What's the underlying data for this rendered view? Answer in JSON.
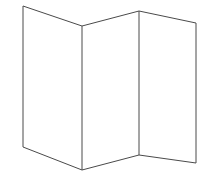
{
  "figure": {
    "kind": "line-drawing",
    "canvas": {
      "width": 212,
      "height": 184
    },
    "colors": {
      "background": "#ffffff",
      "stroke": "#4a4a4a",
      "fill": "#ffffff"
    },
    "stroke_width": 1,
    "vertices": {
      "top_left": {
        "x": 23,
        "y": 6
      },
      "top_valley": {
        "x": 82,
        "y": 26
      },
      "top_peak": {
        "x": 139,
        "y": 11
      },
      "top_right": {
        "x": 196,
        "y": 23
      },
      "bottom_left": {
        "x": 23,
        "y": 147
      },
      "bottom_valley": {
        "x": 82,
        "y": 170
      },
      "bottom_peak": {
        "x": 139,
        "y": 155
      },
      "bottom_right": {
        "x": 196,
        "y": 163
      }
    },
    "panels": [
      {
        "id": "panel-left",
        "label": "Left panel",
        "points": "23,6 82,26 82,170 23,147"
      },
      {
        "id": "panel-middle",
        "label": "Middle panel",
        "points": "82,26 139,11 139,155 82,170"
      },
      {
        "id": "panel-right",
        "label": "Right panel",
        "points": "139,11 196,23 196,163 139,155"
      }
    ],
    "outline": "M 23,6 L 82,26 L 139,11 L 196,23 L 196,163 L 139,155 L 82,170 L 23,147 Z",
    "fold_lines": [
      {
        "id": "fold-1",
        "label": "First fold (valley)",
        "x1": 82,
        "y1": 26,
        "x2": 82,
        "y2": 170
      },
      {
        "id": "fold-2",
        "label": "Second fold (peak)",
        "x1": 139,
        "y1": 11,
        "x2": 139,
        "y2": 155
      }
    ]
  }
}
